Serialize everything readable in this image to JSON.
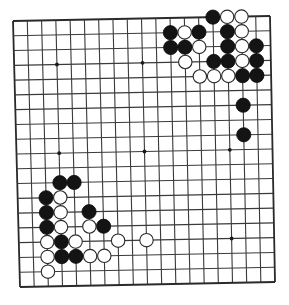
{
  "board": {
    "size": 19,
    "corners": {
      "top_left": [
        13,
        21
      ],
      "top_right": [
        270,
        16
      ],
      "bottom_left": [
        20,
        287
      ],
      "bottom_right": [
        275,
        282
      ]
    },
    "colors": {
      "background": "#ffffff",
      "line": "#3a3a3a",
      "black_stone": "#141414",
      "white_stone": "#ffffff"
    },
    "star_points": [
      [
        3,
        3
      ],
      [
        9,
        3
      ],
      [
        15,
        3
      ],
      [
        3,
        9
      ],
      [
        9,
        9
      ],
      [
        15,
        9
      ],
      [
        3,
        15
      ],
      [
        9,
        15
      ],
      [
        15,
        15
      ]
    ],
    "stone_radius": 7.1
  },
  "stones": {
    "black": [
      [
        14,
        0
      ],
      [
        11,
        1
      ],
      [
        13,
        1
      ],
      [
        15,
        1
      ],
      [
        11,
        2
      ],
      [
        12,
        2
      ],
      [
        15,
        2
      ],
      [
        17,
        2
      ],
      [
        14,
        3
      ],
      [
        15,
        3
      ],
      [
        17,
        3
      ],
      [
        16,
        4
      ],
      [
        17,
        4
      ],
      [
        16,
        6
      ],
      [
        16,
        8
      ],
      [
        3,
        11
      ],
      [
        4,
        11
      ],
      [
        2,
        12
      ],
      [
        2,
        13
      ],
      [
        5,
        13
      ],
      [
        2,
        14
      ],
      [
        6,
        14
      ],
      [
        3,
        15
      ],
      [
        3,
        16
      ],
      [
        4,
        16
      ]
    ],
    "white": [
      [
        15,
        0
      ],
      [
        16,
        0
      ],
      [
        12,
        1
      ],
      [
        16,
        1
      ],
      [
        13,
        2
      ],
      [
        16,
        2
      ],
      [
        12,
        3
      ],
      [
        16,
        3
      ],
      [
        13,
        4
      ],
      [
        14,
        4
      ],
      [
        15,
        4
      ],
      [
        3,
        12
      ],
      [
        3,
        13
      ],
      [
        3,
        14
      ],
      [
        5,
        14
      ],
      [
        2,
        15
      ],
      [
        4,
        15
      ],
      [
        7,
        15
      ],
      [
        9,
        15
      ],
      [
        2,
        16
      ],
      [
        5,
        16
      ],
      [
        6,
        16
      ],
      [
        2,
        17
      ]
    ]
  }
}
